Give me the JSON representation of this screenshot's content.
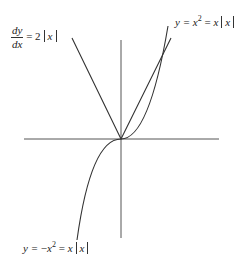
{
  "diagram": {
    "labels": {
      "derivative": {
        "numerator": "dy",
        "denominator": "dx",
        "eq": "= 2",
        "var": "x"
      },
      "upper_curve": {
        "lhs": "y =",
        "x": "x",
        "sq": "2",
        "eq": "=",
        "x2": "x",
        "var": "x"
      },
      "lower_curve": {
        "lhs": "y =",
        "neg": "−",
        "x": "x",
        "sq": "2",
        "eq": "=",
        "x2": "x",
        "var": "x"
      }
    },
    "colors": {
      "line": "#333333",
      "axis": "#555555",
      "background": "#ffffff"
    },
    "origin": [
      121,
      139
    ]
  }
}
